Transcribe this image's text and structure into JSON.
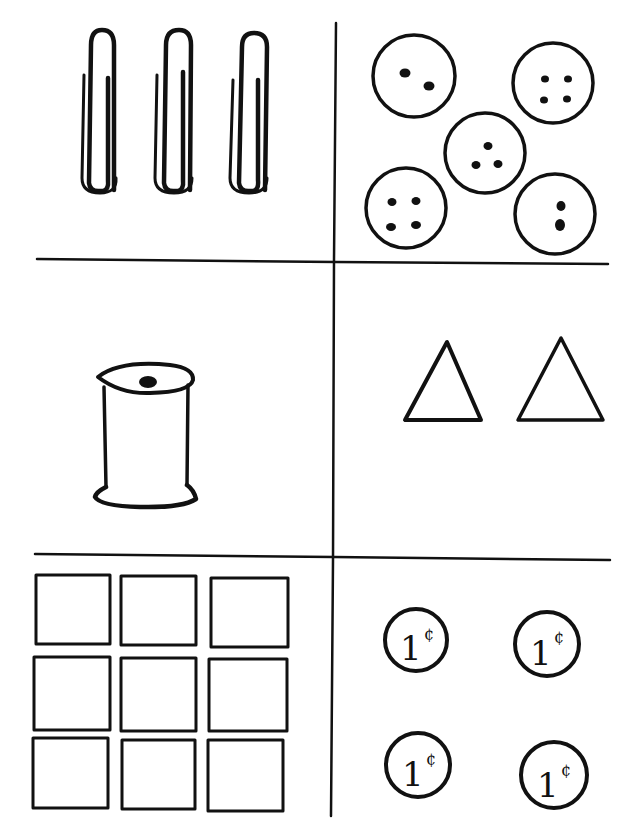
{
  "worksheet": {
    "title": "",
    "layout": {
      "rows": 3,
      "cols": 2
    },
    "ink_color": "#111111",
    "background": "#ffffff",
    "panels": [
      {
        "id": "paperclips",
        "object": "paper-clip",
        "count": 3
      },
      {
        "id": "buttons",
        "object": "button",
        "count": 5,
        "holes_per_button": [
          2,
          4,
          3,
          4,
          2
        ]
      },
      {
        "id": "spool",
        "object": "thread-spool",
        "count": 1
      },
      {
        "id": "triangles",
        "object": "triangle",
        "count": 2
      },
      {
        "id": "squares",
        "object": "square",
        "count": 9
      },
      {
        "id": "pennies",
        "object": "penny",
        "count": 4,
        "coin_label": "1¢"
      }
    ]
  },
  "coins": [
    {
      "value": "1",
      "unit": "¢"
    },
    {
      "value": "1",
      "unit": "¢"
    },
    {
      "value": "1",
      "unit": "¢"
    },
    {
      "value": "1",
      "unit": "¢"
    }
  ]
}
